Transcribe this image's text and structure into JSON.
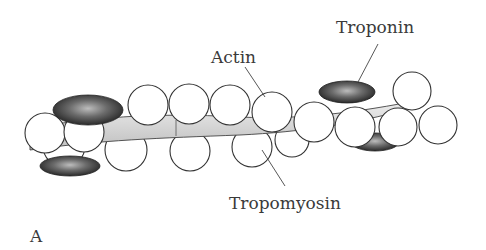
{
  "figure": {
    "panel_label": "A",
    "labels": {
      "actin": "Actin",
      "troponin": "Troponin",
      "tropomyosin": "Tropomyosin"
    },
    "colors": {
      "outline": "#333333",
      "bead_fill": "#ffffff",
      "tropomyosin_fill": "#d9d9d9",
      "troponin_fill": "#2a2a2a",
      "label_text": "#3a3a3a"
    }
  }
}
